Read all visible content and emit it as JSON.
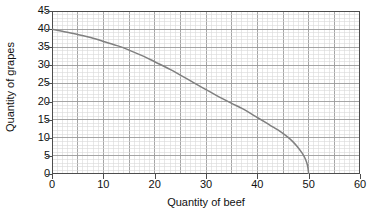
{
  "chart_data": {
    "type": "line",
    "title": "",
    "xlabel": "Quantity of beef",
    "ylabel": "Quantity of grapes",
    "xlim": [
      0,
      60
    ],
    "ylim": [
      0,
      45
    ],
    "xticks": [
      0,
      10,
      20,
      30,
      40,
      50,
      60
    ],
    "yticks": [
      0,
      5,
      10,
      15,
      20,
      25,
      30,
      35,
      40,
      45
    ],
    "xtick_labels": [
      "0",
      "10",
      "20",
      "30",
      "40",
      "50",
      "60"
    ],
    "ytick_labels": [
      "0",
      "5",
      "10",
      "15",
      "20",
      "25",
      "30",
      "35",
      "40",
      "45"
    ],
    "grid": true,
    "grid_minor_x_step": 1,
    "grid_minor_y_step": 1,
    "grid_major_x_step": 5,
    "grid_major_y_step": 5,
    "legend": null,
    "series": [
      {
        "name": "Production possibility frontier",
        "color": "#808080",
        "x": [
          0,
          2,
          5,
          8,
          10,
          13,
          15,
          18,
          20,
          23,
          25,
          28,
          30,
          32,
          35,
          37,
          40,
          42,
          43,
          44.5,
          46,
          47,
          48,
          48.8,
          49.4,
          49.8,
          50
        ],
        "y": [
          40,
          39.4,
          38.5,
          37.5,
          36.6,
          35.3,
          34.2,
          32.4,
          31.0,
          28.9,
          27.3,
          24.9,
          23.3,
          21.7,
          19.5,
          18.1,
          15.6,
          13.9,
          13.0,
          11.7,
          10.1,
          8.8,
          7.2,
          5.6,
          4.0,
          2.2,
          0
        ]
      }
    ],
    "annotations": []
  },
  "axes": {
    "y_title": "Quantity of grapes",
    "x_title": "Quantity of beef"
  },
  "style": {
    "curve_color": "#808080",
    "axis_color": "#4d4d4d",
    "grid_minor_color": "#d9d9d9",
    "grid_major_color": "#9b9b9b",
    "background": "#ffffff",
    "text_color": "#111111"
  }
}
